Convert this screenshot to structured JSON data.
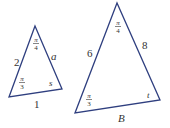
{
  "colors": {
    "line": "#2f3f7f",
    "text": "#333333",
    "background": "#ffffff"
  },
  "small_triangle": {
    "side_left": "2",
    "side_right": "a",
    "side_bottom": "1",
    "angle_top_num": "π",
    "angle_top_den": "4",
    "angle_left_num": "π",
    "angle_left_den": "3",
    "angle_right": "s"
  },
  "large_triangle": {
    "side_left": "6",
    "side_right": "8",
    "side_bottom": "B",
    "angle_top_num": "π",
    "angle_top_den": "4",
    "angle_left_num": "π",
    "angle_left_den": "3",
    "angle_right": "t"
  }
}
